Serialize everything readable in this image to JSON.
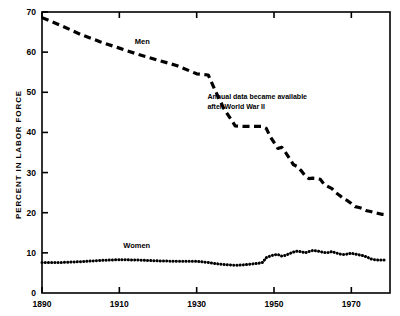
{
  "chart_data": {
    "type": "line",
    "title": "",
    "xlabel": "",
    "ylabel": "PERCENT IN LABOR FORCE",
    "xlim": [
      1890,
      1980
    ],
    "ylim": [
      0,
      70
    ],
    "xticks": [
      1890,
      1910,
      1930,
      1950,
      1970
    ],
    "xticklabels": [
      "1890",
      "1910",
      "1930",
      "1950",
      "1970"
    ],
    "yticks": [
      0,
      10,
      20,
      30,
      40,
      50,
      60,
      70
    ],
    "yticklabels": [
      "0",
      "10",
      "20",
      "30",
      "40",
      "50",
      "60",
      "70"
    ],
    "grid": false,
    "legend_position": "inline-labels",
    "series": [
      {
        "name": "Men",
        "label": "Men",
        "style": "dashed",
        "color": "#000000",
        "points": [
          [
            1890,
            68.6
          ],
          [
            1895,
            66.6
          ],
          [
            1900,
            64.4
          ],
          [
            1905,
            62.6
          ],
          [
            1910,
            61.0
          ],
          [
            1915,
            59.4
          ],
          [
            1920,
            58.0
          ],
          [
            1925,
            56.6
          ],
          [
            1930,
            54.6
          ],
          [
            1933,
            54.3
          ],
          [
            1935,
            50.0
          ],
          [
            1937,
            46.0
          ],
          [
            1940,
            41.6
          ],
          [
            1942,
            41.5
          ],
          [
            1944,
            41.5
          ],
          [
            1946,
            41.5
          ],
          [
            1947,
            41.5
          ],
          [
            1948,
            41.0
          ],
          [
            1949,
            39.0
          ],
          [
            1950,
            37.5
          ],
          [
            1951,
            36.0
          ],
          [
            1952,
            36.3
          ],
          [
            1953,
            35.0
          ],
          [
            1954,
            33.5
          ],
          [
            1955,
            32.0
          ],
          [
            1956,
            31.5
          ],
          [
            1957,
            30.5
          ],
          [
            1958,
            29.3
          ],
          [
            1959,
            28.5
          ],
          [
            1960,
            28.6
          ],
          [
            1961,
            28.5
          ],
          [
            1962,
            28.3
          ],
          [
            1963,
            27.0
          ],
          [
            1964,
            26.5
          ],
          [
            1965,
            26.0
          ],
          [
            1966,
            25.0
          ],
          [
            1967,
            24.3
          ],
          [
            1968,
            23.5
          ],
          [
            1969,
            23.0
          ],
          [
            1970,
            22.3
          ],
          [
            1971,
            21.5
          ],
          [
            1972,
            21.3
          ],
          [
            1973,
            21.0
          ],
          [
            1974,
            20.5
          ],
          [
            1975,
            20.3
          ],
          [
            1976,
            20.0
          ],
          [
            1977,
            19.8
          ],
          [
            1978,
            19.6
          ],
          [
            1979,
            19.5
          ]
        ]
      },
      {
        "name": "Women",
        "label": "Women",
        "style": "dotted",
        "color": "#000000",
        "points": [
          [
            1890,
            7.6
          ],
          [
            1895,
            7.6
          ],
          [
            1900,
            7.8
          ],
          [
            1905,
            8.1
          ],
          [
            1910,
            8.3
          ],
          [
            1915,
            8.2
          ],
          [
            1920,
            8.0
          ],
          [
            1925,
            7.9
          ],
          [
            1930,
            7.9
          ],
          [
            1933,
            7.6
          ],
          [
            1935,
            7.3
          ],
          [
            1937,
            7.1
          ],
          [
            1940,
            6.9
          ],
          [
            1942,
            7.0
          ],
          [
            1944,
            7.2
          ],
          [
            1946,
            7.4
          ],
          [
            1947,
            7.6
          ],
          [
            1948,
            8.8
          ],
          [
            1949,
            9.2
          ],
          [
            1950,
            9.5
          ],
          [
            1951,
            9.6
          ],
          [
            1952,
            9.2
          ],
          [
            1953,
            9.4
          ],
          [
            1954,
            9.8
          ],
          [
            1955,
            10.2
          ],
          [
            1956,
            10.4
          ],
          [
            1957,
            10.3
          ],
          [
            1958,
            10.0
          ],
          [
            1959,
            10.3
          ],
          [
            1960,
            10.6
          ],
          [
            1961,
            10.5
          ],
          [
            1962,
            10.3
          ],
          [
            1963,
            10.1
          ],
          [
            1964,
            10.1
          ],
          [
            1965,
            10.3
          ],
          [
            1966,
            10.0
          ],
          [
            1967,
            9.7
          ],
          [
            1968,
            9.6
          ],
          [
            1969,
            9.7
          ],
          [
            1970,
            9.9
          ],
          [
            1971,
            9.7
          ],
          [
            1972,
            9.5
          ],
          [
            1973,
            9.3
          ],
          [
            1974,
            9.0
          ],
          [
            1975,
            8.5
          ],
          [
            1976,
            8.3
          ],
          [
            1977,
            8.2
          ],
          [
            1978,
            8.2
          ],
          [
            1979,
            8.2
          ]
        ]
      }
    ],
    "annotations": [
      {
        "name": "world-war-ii-note",
        "line1": "Annual data became available",
        "line2": "after World War II",
        "x": 1947,
        "y": 48
      }
    ]
  }
}
